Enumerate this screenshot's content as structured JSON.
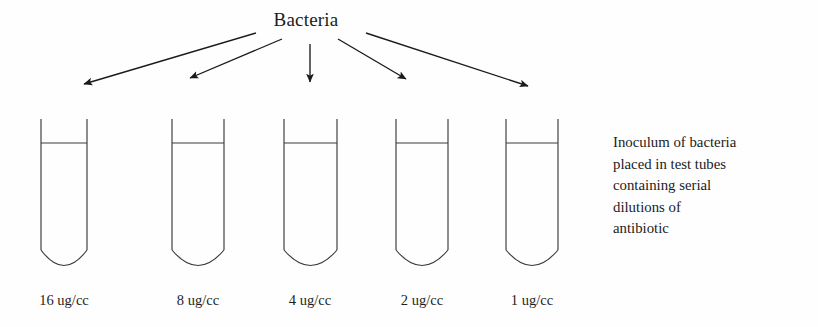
{
  "diagram": {
    "title": "Bacteria",
    "caption_lines": [
      "Inoculum of bacteria",
      "placed in test tubes",
      "containing serial",
      "dilutions of",
      "antibiotic"
    ],
    "stroke_color": "#3a3a3a",
    "arrow_color": "#1a1a1a",
    "background_color": "#fefefe",
    "tubes": [
      {
        "label": "16 ug/cc",
        "x_left": 41,
        "x_right": 87,
        "center": 64
      },
      {
        "label": "8 ug/cc",
        "x_left": 172,
        "x_right": 224,
        "center": 198
      },
      {
        "label": "4 ug/cc",
        "x_left": 284,
        "x_right": 337,
        "center": 310
      },
      {
        "label": "2 ug/cc",
        "x_left": 396,
        "x_right": 448,
        "center": 422
      },
      {
        "label": "1 ug/cc",
        "x_left": 506,
        "x_right": 558,
        "center": 532
      }
    ],
    "geometry": {
      "tube_top_y": 119,
      "liquid_line_y": 143,
      "tube_side_bottom_y": 250,
      "tube_curve_bottom_y": 270,
      "arrow_origin_y": 32,
      "label_y": 292
    },
    "arrows": [
      {
        "name": "arrow-to-tube-1",
        "x1": 256,
        "y1": 33,
        "x2": 84,
        "y2": 84
      },
      {
        "name": "arrow-to-tube-2",
        "x1": 282,
        "y1": 39,
        "x2": 190,
        "y2": 78
      },
      {
        "name": "arrow-to-tube-3",
        "x1": 310,
        "y1": 44,
        "x2": 310,
        "y2": 82
      },
      {
        "name": "arrow-to-tube-4",
        "x1": 338,
        "y1": 39,
        "x2": 406,
        "y2": 79
      },
      {
        "name": "arrow-to-tube-5",
        "x1": 366,
        "y1": 33,
        "x2": 528,
        "y2": 86
      }
    ]
  }
}
